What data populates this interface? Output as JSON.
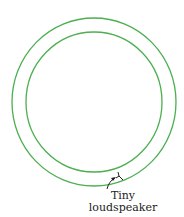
{
  "diagram": {
    "rings": [
      {
        "name": "outer",
        "cx": 94,
        "cy": 102,
        "rx": 82,
        "ry": 84,
        "color": "#4caf50"
      },
      {
        "name": "inner",
        "cx": 94,
        "cy": 102,
        "rx": 68,
        "ry": 70,
        "color": "#4caf50"
      }
    ],
    "annotation": {
      "line1": "Tiny",
      "line2": "loudspeaker"
    }
  }
}
